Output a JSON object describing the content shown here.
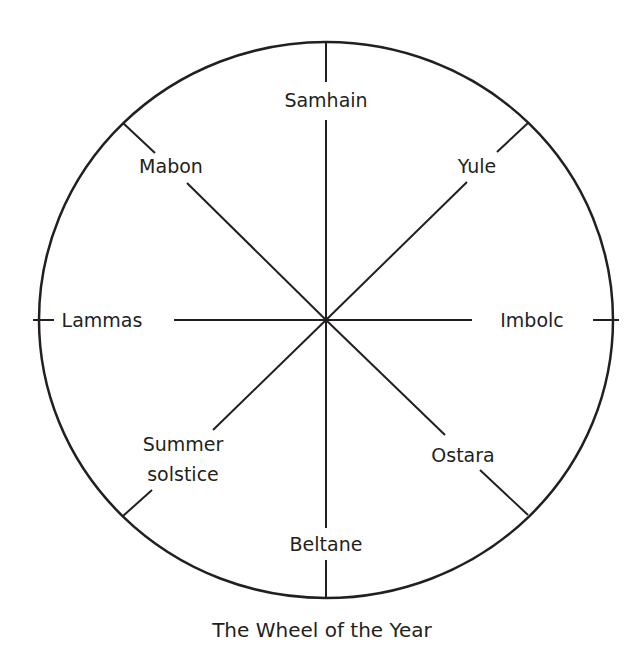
{
  "diagram": {
    "title": "The Wheel of the Year",
    "colors": {
      "line": "#231f20",
      "text": "#231f20",
      "background": "#ffffff"
    },
    "labels": {
      "samhain": "Samhain",
      "yule": "Yule",
      "imbolc": "Imbolc",
      "ostara": "Ostara",
      "beltane": "Beltane",
      "summer_solstice_line1": "Summer",
      "summer_solstice_line2": "solstice",
      "lammas": "Lammas",
      "mabon": "Mabon"
    }
  }
}
